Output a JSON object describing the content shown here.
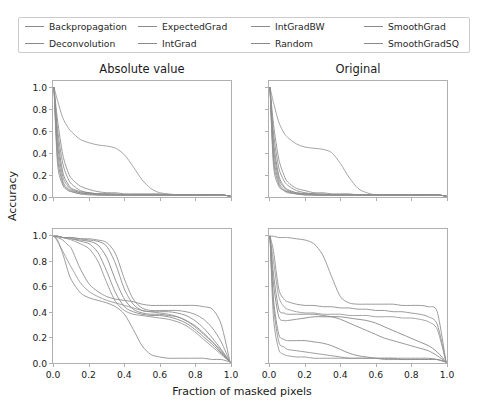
{
  "legend": {
    "entries": [
      {
        "label": "Backpropagation",
        "color": "#8a8a8a"
      },
      {
        "label": "Deconvolution",
        "color": "#8a8a8a"
      },
      {
        "label": "ExpectedGrad",
        "color": "#8a8a8a"
      },
      {
        "label": "IntGrad",
        "color": "#8a8a8a"
      },
      {
        "label": "IntGradBW",
        "color": "#8a8a8a"
      },
      {
        "label": "Random",
        "color": "#8a8a8a"
      },
      {
        "label": "SmoothGrad",
        "color": "#8a8a8a"
      },
      {
        "label": "SmoothGradSQ",
        "color": "#8a8a8a"
      }
    ]
  },
  "axes": {
    "ylabel": "Accuracy",
    "xlabel": "Fraction of masked pixels",
    "xticks": [
      "0.0",
      "0.2",
      "0.4",
      "0.6",
      "0.8",
      "1.0"
    ],
    "yticks": [
      "1.0",
      "0.8",
      "0.6",
      "0.4",
      "0.2",
      "0.0"
    ],
    "xlim": [
      0.0,
      1.0
    ],
    "ylim": [
      0.0,
      1.0
    ]
  },
  "chart_data": {
    "type": "line",
    "title": "",
    "xlabel": "Fraction of masked pixels",
    "ylabel": "Accuracy",
    "xlim": [
      0.0,
      1.0
    ],
    "ylim": [
      0.0,
      1.05
    ],
    "grid": false,
    "legend_position": "top",
    "column_titles": [
      "Absolute value",
      "Original"
    ],
    "x": [
      0.0,
      0.02,
      0.05,
      0.08,
      0.1,
      0.15,
      0.2,
      0.25,
      0.3,
      0.35,
      0.4,
      0.45,
      0.5,
      0.55,
      0.6,
      0.65,
      0.7,
      0.75,
      0.8,
      0.85,
      0.9,
      0.95,
      1.0
    ],
    "panels": [
      {
        "name": "top-left",
        "title": "Absolute value",
        "row": 0,
        "col": 0,
        "series": [
          {
            "name": "Backpropagation",
            "values": [
              1.0,
              0.62,
              0.3,
              0.16,
              0.11,
              0.05,
              0.03,
              0.02,
              0.02,
              0.01,
              0.01,
              0.01,
              0.01,
              0.01,
              0.01,
              0.01,
              0.01,
              0.01,
              0.01,
              0.01,
              0.01,
              0.01,
              0.0
            ]
          },
          {
            "name": "Deconvolution",
            "values": [
              1.0,
              0.88,
              0.72,
              0.63,
              0.59,
              0.52,
              0.49,
              0.47,
              0.46,
              0.44,
              0.38,
              0.27,
              0.15,
              0.07,
              0.03,
              0.02,
              0.01,
              0.01,
              0.01,
              0.01,
              0.01,
              0.01,
              0.0
            ]
          },
          {
            "name": "ExpectedGrad",
            "values": [
              1.0,
              0.55,
              0.22,
              0.11,
              0.07,
              0.04,
              0.03,
              0.02,
              0.02,
              0.02,
              0.01,
              0.01,
              0.01,
              0.01,
              0.01,
              0.01,
              0.01,
              0.01,
              0.01,
              0.01,
              0.01,
              0.01,
              0.0
            ]
          },
          {
            "name": "IntGrad",
            "values": [
              1.0,
              0.48,
              0.18,
              0.09,
              0.06,
              0.03,
              0.02,
              0.02,
              0.01,
              0.01,
              0.01,
              0.01,
              0.01,
              0.01,
              0.01,
              0.01,
              0.01,
              0.01,
              0.01,
              0.01,
              0.01,
              0.01,
              0.0
            ]
          },
          {
            "name": "IntGradBW",
            "values": [
              1.0,
              0.42,
              0.14,
              0.07,
              0.05,
              0.03,
              0.02,
              0.01,
              0.01,
              0.01,
              0.01,
              0.01,
              0.01,
              0.01,
              0.01,
              0.01,
              0.01,
              0.01,
              0.01,
              0.01,
              0.01,
              0.01,
              0.0
            ]
          },
          {
            "name": "Random",
            "values": [
              1.0,
              0.7,
              0.38,
              0.22,
              0.16,
              0.09,
              0.06,
              0.04,
              0.03,
              0.03,
              0.02,
              0.02,
              0.02,
              0.02,
              0.02,
              0.01,
              0.01,
              0.01,
              0.01,
              0.01,
              0.01,
              0.01,
              0.0
            ]
          },
          {
            "name": "SmoothGrad",
            "values": [
              1.0,
              0.36,
              0.12,
              0.06,
              0.04,
              0.02,
              0.02,
              0.01,
              0.01,
              0.01,
              0.01,
              0.01,
              0.01,
              0.01,
              0.01,
              0.01,
              0.01,
              0.01,
              0.01,
              0.01,
              0.01,
              0.01,
              0.0
            ]
          },
          {
            "name": "SmoothGradSQ",
            "values": [
              1.0,
              0.3,
              0.1,
              0.05,
              0.04,
              0.02,
              0.01,
              0.01,
              0.01,
              0.01,
              0.01,
              0.01,
              0.01,
              0.01,
              0.01,
              0.01,
              0.01,
              0.01,
              0.01,
              0.01,
              0.01,
              0.01,
              0.0
            ]
          }
        ]
      },
      {
        "name": "top-right",
        "title": "Original",
        "row": 0,
        "col": 1,
        "series": [
          {
            "name": "Backpropagation",
            "values": [
              1.0,
              0.58,
              0.26,
              0.14,
              0.1,
              0.05,
              0.03,
              0.02,
              0.02,
              0.01,
              0.01,
              0.01,
              0.01,
              0.01,
              0.01,
              0.01,
              0.01,
              0.01,
              0.01,
              0.01,
              0.01,
              0.01,
              0.0
            ]
          },
          {
            "name": "Deconvolution",
            "values": [
              1.0,
              0.86,
              0.68,
              0.58,
              0.54,
              0.48,
              0.45,
              0.44,
              0.43,
              0.4,
              0.3,
              0.17,
              0.07,
              0.03,
              0.01,
              0.01,
              0.01,
              0.01,
              0.01,
              0.01,
              0.01,
              0.01,
              0.0
            ]
          },
          {
            "name": "ExpectedGrad",
            "values": [
              1.0,
              0.5,
              0.19,
              0.09,
              0.06,
              0.03,
              0.02,
              0.02,
              0.01,
              0.01,
              0.01,
              0.01,
              0.01,
              0.01,
              0.01,
              0.01,
              0.01,
              0.01,
              0.01,
              0.01,
              0.01,
              0.01,
              0.0
            ]
          },
          {
            "name": "IntGrad",
            "values": [
              1.0,
              0.44,
              0.16,
              0.08,
              0.05,
              0.03,
              0.02,
              0.01,
              0.01,
              0.01,
              0.01,
              0.01,
              0.01,
              0.01,
              0.01,
              0.01,
              0.01,
              0.01,
              0.01,
              0.01,
              0.01,
              0.01,
              0.0
            ]
          },
          {
            "name": "IntGradBW",
            "values": [
              1.0,
              0.38,
              0.13,
              0.06,
              0.04,
              0.02,
              0.02,
              0.01,
              0.01,
              0.01,
              0.01,
              0.01,
              0.01,
              0.01,
              0.01,
              0.01,
              0.01,
              0.01,
              0.01,
              0.01,
              0.01,
              0.01,
              0.0
            ]
          },
          {
            "name": "Random",
            "values": [
              1.0,
              0.66,
              0.34,
              0.19,
              0.13,
              0.07,
              0.05,
              0.03,
              0.03,
              0.02,
              0.02,
              0.02,
              0.01,
              0.01,
              0.01,
              0.01,
              0.01,
              0.01,
              0.01,
              0.01,
              0.01,
              0.01,
              0.0
            ]
          },
          {
            "name": "SmoothGrad",
            "values": [
              1.0,
              0.33,
              0.11,
              0.05,
              0.04,
              0.02,
              0.01,
              0.01,
              0.01,
              0.01,
              0.01,
              0.01,
              0.01,
              0.01,
              0.01,
              0.01,
              0.01,
              0.01,
              0.01,
              0.01,
              0.01,
              0.01,
              0.0
            ]
          },
          {
            "name": "SmoothGradSQ",
            "values": [
              1.0,
              0.28,
              0.09,
              0.05,
              0.03,
              0.02,
              0.01,
              0.01,
              0.01,
              0.01,
              0.01,
              0.01,
              0.01,
              0.01,
              0.01,
              0.01,
              0.01,
              0.01,
              0.01,
              0.01,
              0.01,
              0.01,
              0.0
            ]
          }
        ]
      },
      {
        "name": "bottom-left",
        "title": "",
        "row": 1,
        "col": 0,
        "series": [
          {
            "name": "Backpropagation",
            "values": [
              1.0,
              0.99,
              0.97,
              0.93,
              0.9,
              0.74,
              0.62,
              0.56,
              0.52,
              0.5,
              0.49,
              0.48,
              0.46,
              0.45,
              0.45,
              0.45,
              0.45,
              0.45,
              0.45,
              0.44,
              0.42,
              0.3,
              0.0
            ]
          },
          {
            "name": "Deconvolution",
            "values": [
              1.0,
              0.96,
              0.88,
              0.8,
              0.75,
              0.63,
              0.56,
              0.52,
              0.49,
              0.47,
              0.45,
              0.43,
              0.41,
              0.4,
              0.39,
              0.38,
              0.36,
              0.33,
              0.28,
              0.22,
              0.16,
              0.09,
              0.0
            ]
          },
          {
            "name": "ExpectedGrad",
            "values": [
              1.0,
              1.0,
              0.99,
              0.99,
              0.98,
              0.97,
              0.96,
              0.93,
              0.83,
              0.65,
              0.5,
              0.42,
              0.39,
              0.38,
              0.38,
              0.37,
              0.36,
              0.33,
              0.29,
              0.23,
              0.16,
              0.08,
              0.0
            ]
          },
          {
            "name": "IntGrad",
            "values": [
              1.0,
              1.0,
              0.99,
              0.98,
              0.98,
              0.96,
              0.94,
              0.87,
              0.72,
              0.55,
              0.44,
              0.4,
              0.38,
              0.37,
              0.37,
              0.36,
              0.34,
              0.31,
              0.26,
              0.2,
              0.14,
              0.07,
              0.0
            ]
          },
          {
            "name": "IntGradBW",
            "values": [
              1.0,
              1.0,
              0.99,
              0.98,
              0.97,
              0.94,
              0.9,
              0.8,
              0.63,
              0.48,
              0.41,
              0.38,
              0.37,
              0.36,
              0.35,
              0.34,
              0.32,
              0.29,
              0.24,
              0.18,
              0.12,
              0.06,
              0.0
            ]
          },
          {
            "name": "Random",
            "values": [
              1.0,
              0.97,
              0.86,
              0.72,
              0.65,
              0.55,
              0.51,
              0.49,
              0.47,
              0.44,
              0.38,
              0.26,
              0.13,
              0.06,
              0.04,
              0.03,
              0.03,
              0.03,
              0.03,
              0.03,
              0.02,
              0.02,
              0.0
            ]
          },
          {
            "name": "SmoothGrad",
            "values": [
              1.0,
              1.0,
              0.99,
              0.99,
              0.99,
              0.98,
              0.97,
              0.96,
              0.92,
              0.78,
              0.58,
              0.46,
              0.41,
              0.4,
              0.4,
              0.4,
              0.39,
              0.37,
              0.33,
              0.27,
              0.19,
              0.1,
              0.0
            ]
          },
          {
            "name": "SmoothGradSQ",
            "values": [
              1.0,
              1.0,
              0.99,
              0.99,
              0.99,
              0.98,
              0.98,
              0.97,
              0.95,
              0.86,
              0.66,
              0.5,
              0.43,
              0.41,
              0.41,
              0.41,
              0.41,
              0.4,
              0.38,
              0.34,
              0.27,
              0.16,
              0.0
            ]
          }
        ]
      },
      {
        "name": "bottom-right",
        "title": "",
        "row": 1,
        "col": 1,
        "series": [
          {
            "name": "Backpropagation",
            "values": [
              1.0,
              0.88,
              0.58,
              0.5,
              0.48,
              0.46,
              0.45,
              0.45,
              0.44,
              0.44,
              0.43,
              0.43,
              0.42,
              0.42,
              0.41,
              0.41,
              0.4,
              0.4,
              0.39,
              0.38,
              0.36,
              0.3,
              0.0
            ]
          },
          {
            "name": "Deconvolution",
            "values": [
              1.0,
              0.8,
              0.52,
              0.44,
              0.42,
              0.4,
              0.39,
              0.39,
              0.38,
              0.38,
              0.38,
              0.37,
              0.37,
              0.37,
              0.36,
              0.36,
              0.36,
              0.35,
              0.35,
              0.34,
              0.32,
              0.26,
              0.0
            ]
          },
          {
            "name": "ExpectedGrad",
            "values": [
              1.0,
              0.62,
              0.36,
              0.33,
              0.33,
              0.34,
              0.35,
              0.36,
              0.36,
              0.36,
              0.36,
              0.35,
              0.34,
              0.33,
              0.31,
              0.28,
              0.25,
              0.22,
              0.19,
              0.16,
              0.13,
              0.08,
              0.0
            ]
          },
          {
            "name": "IntGrad",
            "values": [
              1.0,
              0.5,
              0.22,
              0.18,
              0.17,
              0.17,
              0.17,
              0.16,
              0.15,
              0.13,
              0.1,
              0.07,
              0.05,
              0.04,
              0.03,
              0.03,
              0.03,
              0.03,
              0.03,
              0.03,
              0.03,
              0.02,
              0.0
            ]
          },
          {
            "name": "IntGradBW",
            "values": [
              1.0,
              0.35,
              0.1,
              0.06,
              0.05,
              0.04,
              0.04,
              0.03,
              0.03,
              0.03,
              0.03,
              0.03,
              0.03,
              0.03,
              0.03,
              0.03,
              0.03,
              0.02,
              0.02,
              0.02,
              0.02,
              0.02,
              0.0
            ]
          },
          {
            "name": "Random",
            "values": [
              1.0,
              1.0,
              0.99,
              0.99,
              0.99,
              0.98,
              0.97,
              0.94,
              0.85,
              0.68,
              0.52,
              0.47,
              0.46,
              0.46,
              0.46,
              0.46,
              0.46,
              0.45,
              0.45,
              0.45,
              0.44,
              0.4,
              0.0
            ]
          },
          {
            "name": "SmoothGrad",
            "values": [
              1.0,
              0.7,
              0.42,
              0.39,
              0.38,
              0.38,
              0.38,
              0.38,
              0.37,
              0.36,
              0.34,
              0.31,
              0.28,
              0.25,
              0.22,
              0.19,
              0.17,
              0.15,
              0.13,
              0.11,
              0.09,
              0.05,
              0.0
            ]
          },
          {
            "name": "SmoothGradSQ",
            "values": [
              1.0,
              0.45,
              0.16,
              0.12,
              0.1,
              0.09,
              0.08,
              0.07,
              0.06,
              0.05,
              0.04,
              0.03,
              0.03,
              0.03,
              0.03,
              0.02,
              0.02,
              0.02,
              0.02,
              0.02,
              0.02,
              0.02,
              0.0
            ]
          }
        ]
      }
    ]
  }
}
